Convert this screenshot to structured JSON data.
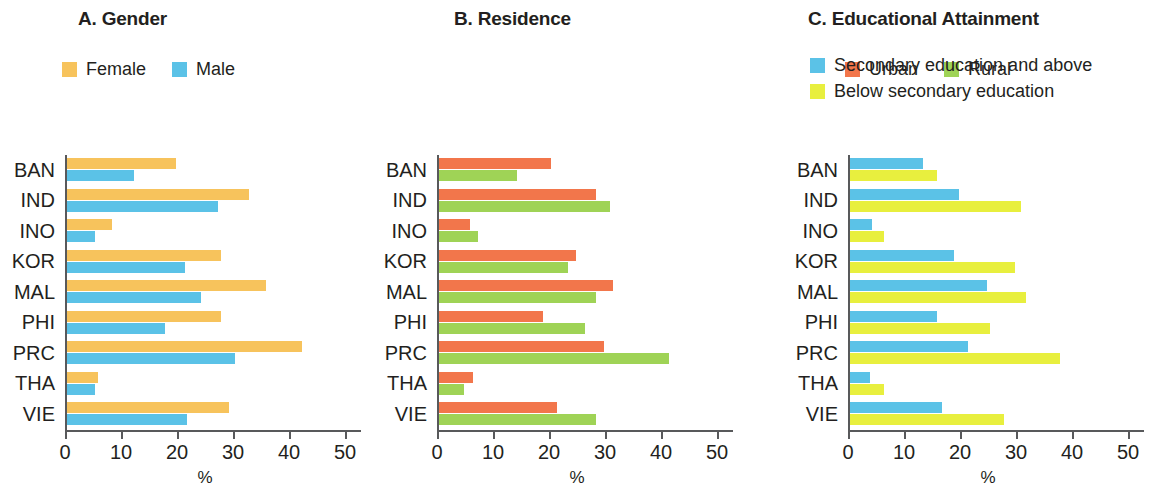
{
  "figure": {
    "categories": [
      "BAN",
      "IND",
      "INO",
      "KOR",
      "MAL",
      "PHI",
      "PRC",
      "THA",
      "VIE"
    ],
    "axis_title": "%",
    "tick_labels": [
      "0",
      "10",
      "20",
      "30",
      "40",
      "50"
    ]
  },
  "colors": {
    "female": "#f7c35c",
    "male": "#5bc2e7",
    "urban": "#f2764b",
    "rural": "#9fd356",
    "secondary_and_above": "#5bc2e7",
    "below_secondary": "#e8ef3e",
    "axis": "#58595b",
    "text": "#231f20"
  },
  "panels": {
    "a": {
      "title": "A. Gender",
      "legend": [
        {
          "label": "Female",
          "color_key": "female"
        },
        {
          "label": "Male",
          "color_key": "male"
        }
      ]
    },
    "b": {
      "title": "B. Residence",
      "legend": [
        {
          "label": "Urban",
          "color_key": "urban"
        },
        {
          "label": "Rural",
          "color_key": "rural"
        }
      ]
    },
    "c": {
      "title": "C. Educational Attainment",
      "legend": [
        {
          "label": "Secondary education and above",
          "color_key": "secondary_and_above"
        },
        {
          "label": "Below secondary education",
          "color_key": "below_secondary"
        }
      ]
    }
  },
  "chart_data": [
    {
      "type": "bar",
      "title": "A. Gender",
      "orientation": "horizontal",
      "xlabel": "%",
      "ylabel": "",
      "xlim": [
        0,
        50
      ],
      "xticks": [
        0,
        10,
        20,
        30,
        40,
        50
      ],
      "grid": false,
      "legend_position": "top-left",
      "categories": [
        "BAN",
        "IND",
        "INO",
        "KOR",
        "MAL",
        "PHI",
        "PRC",
        "THA",
        "VIE"
      ],
      "series": [
        {
          "name": "Female",
          "color": "#f7c35c",
          "values": [
            19.5,
            32.5,
            8.0,
            27.5,
            35.5,
            27.5,
            42.0,
            5.5,
            29.0
          ]
        },
        {
          "name": "Male",
          "color": "#5bc2e7",
          "values": [
            12.0,
            27.0,
            5.0,
            21.0,
            24.0,
            17.5,
            30.0,
            5.0,
            21.5
          ]
        }
      ]
    },
    {
      "type": "bar",
      "title": "B. Residence",
      "orientation": "horizontal",
      "xlabel": "%",
      "ylabel": "",
      "xlim": [
        0,
        50
      ],
      "xticks": [
        0,
        10,
        20,
        30,
        40,
        50
      ],
      "grid": false,
      "legend_position": "top-left",
      "categories": [
        "BAN",
        "IND",
        "INO",
        "KOR",
        "MAL",
        "PHI",
        "PRC",
        "THA",
        "VIE"
      ],
      "series": [
        {
          "name": "Urban",
          "color": "#f2764b",
          "values": [
            20.0,
            28.0,
            5.5,
            24.5,
            31.0,
            18.5,
            29.5,
            6.0,
            21.0
          ]
        },
        {
          "name": "Rural",
          "color": "#9fd356",
          "values": [
            14.0,
            30.5,
            7.0,
            23.0,
            28.0,
            26.0,
            41.0,
            4.5,
            28.0
          ]
        }
      ]
    },
    {
      "type": "bar",
      "title": "C. Educational Attainment",
      "orientation": "horizontal",
      "xlabel": "%",
      "ylabel": "",
      "xlim": [
        0,
        50
      ],
      "xticks": [
        0,
        10,
        20,
        30,
        40,
        50
      ],
      "grid": false,
      "legend_position": "top-left",
      "categories": [
        "BAN",
        "IND",
        "INO",
        "KOR",
        "MAL",
        "PHI",
        "PRC",
        "THA",
        "VIE"
      ],
      "series": [
        {
          "name": "Secondary education and above",
          "color": "#5bc2e7",
          "values": [
            13.0,
            19.5,
            4.0,
            18.5,
            24.5,
            15.5,
            21.0,
            3.5,
            16.5
          ]
        },
        {
          "name": "Below secondary education",
          "color": "#e8ef3e",
          "values": [
            15.5,
            30.5,
            6.0,
            29.5,
            31.5,
            25.0,
            37.5,
            6.0,
            27.5
          ]
        }
      ]
    }
  ]
}
